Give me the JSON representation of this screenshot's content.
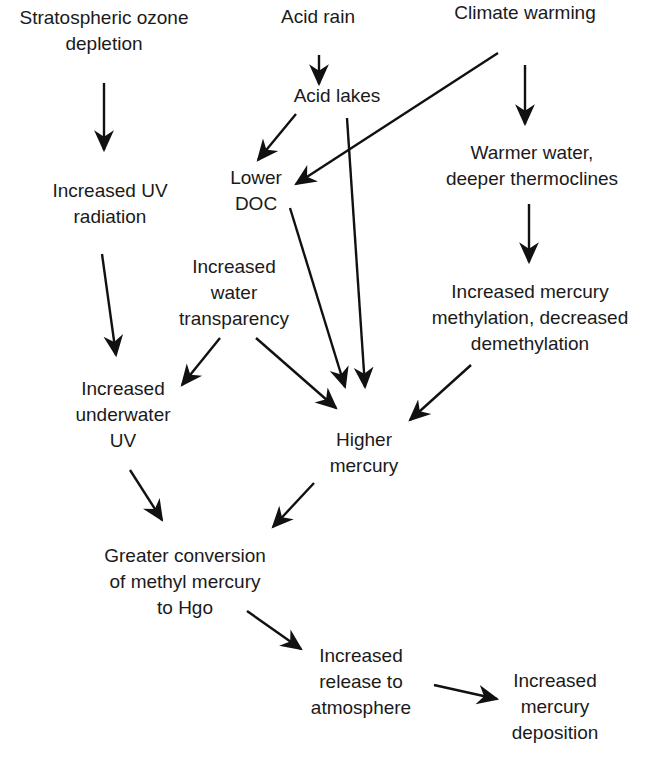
{
  "diagram": {
    "type": "flowchart",
    "nodes": [
      {
        "id": "ozone",
        "lines": [
          "Stratospheric ozone",
          "depletion"
        ]
      },
      {
        "id": "acid_rain",
        "lines": [
          "Acid rain"
        ]
      },
      {
        "id": "climate",
        "lines": [
          "Climate warming"
        ]
      },
      {
        "id": "acid_lakes",
        "lines": [
          "Acid lakes"
        ]
      },
      {
        "id": "uv_rad",
        "lines": [
          "Increased UV",
          "radiation"
        ]
      },
      {
        "id": "lower_doc",
        "lines": [
          "Lower",
          "DOC"
        ]
      },
      {
        "id": "warmer",
        "lines": [
          "Warmer water,",
          "deeper thermoclines"
        ]
      },
      {
        "id": "transparency",
        "lines": [
          "Increased",
          "water",
          "transparency"
        ]
      },
      {
        "id": "methylation",
        "lines": [
          "Increased mercury",
          "methylation, decreased",
          "demethylation"
        ]
      },
      {
        "id": "underwater_uv",
        "lines": [
          "Increased",
          "underwater",
          "UV"
        ]
      },
      {
        "id": "higher_hg",
        "lines": [
          "Higher",
          "mercury"
        ]
      },
      {
        "id": "conversion",
        "lines": [
          "Greater conversion",
          "of methyl mercury",
          "to Hgo"
        ]
      },
      {
        "id": "release",
        "lines": [
          "Increased",
          "release to",
          "atmosphere"
        ]
      },
      {
        "id": "deposition",
        "lines": [
          "Increased",
          "mercury",
          "deposition"
        ]
      }
    ],
    "edges": [
      {
        "from": "ozone",
        "to": "uv_rad"
      },
      {
        "from": "acid_rain",
        "to": "acid_lakes"
      },
      {
        "from": "acid_lakes",
        "to": "lower_doc"
      },
      {
        "from": "climate",
        "to": "lower_doc"
      },
      {
        "from": "climate",
        "to": "warmer"
      },
      {
        "from": "acid_lakes",
        "to": "higher_hg"
      },
      {
        "from": "lower_doc",
        "to": "higher_hg"
      },
      {
        "from": "uv_rad",
        "to": "underwater_uv"
      },
      {
        "from": "transparency",
        "to": "underwater_uv"
      },
      {
        "from": "transparency",
        "to": "higher_hg"
      },
      {
        "from": "warmer",
        "to": "methylation"
      },
      {
        "from": "methylation",
        "to": "higher_hg"
      },
      {
        "from": "underwater_uv",
        "to": "conversion"
      },
      {
        "from": "higher_hg",
        "to": "conversion"
      },
      {
        "from": "conversion",
        "to": "release"
      },
      {
        "from": "release",
        "to": "deposition"
      }
    ],
    "colors": {
      "text": "#1a1a1a",
      "arrow": "#111111",
      "background": "#ffffff"
    }
  }
}
